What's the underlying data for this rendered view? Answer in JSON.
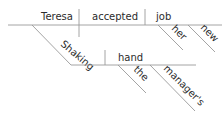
{
  "diagram": {
    "type": "sentence-diagram",
    "main_clause": {
      "subject": "Teresa",
      "verb": "accepted",
      "direct_object": "job",
      "object_modifiers": [
        "her",
        "new"
      ]
    },
    "participial_phrase": {
      "participle": "Shaking",
      "object": "hand",
      "object_modifiers": [
        "the",
        "manager's"
      ]
    },
    "colors": {
      "line": "#9a9a9a",
      "text": "#2b2b2b",
      "background": "#ffffff"
    }
  }
}
